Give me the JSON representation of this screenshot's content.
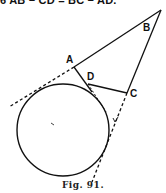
{
  "top_text": "6 AB − CD = BC − AD.",
  "labels": {
    "A": "A",
    "B": "B",
    "C": "C",
    "D": "D"
  },
  "caption": "Fig. 91.",
  "colors": {
    "ink": "#111111",
    "background": "#ffffff"
  }
}
